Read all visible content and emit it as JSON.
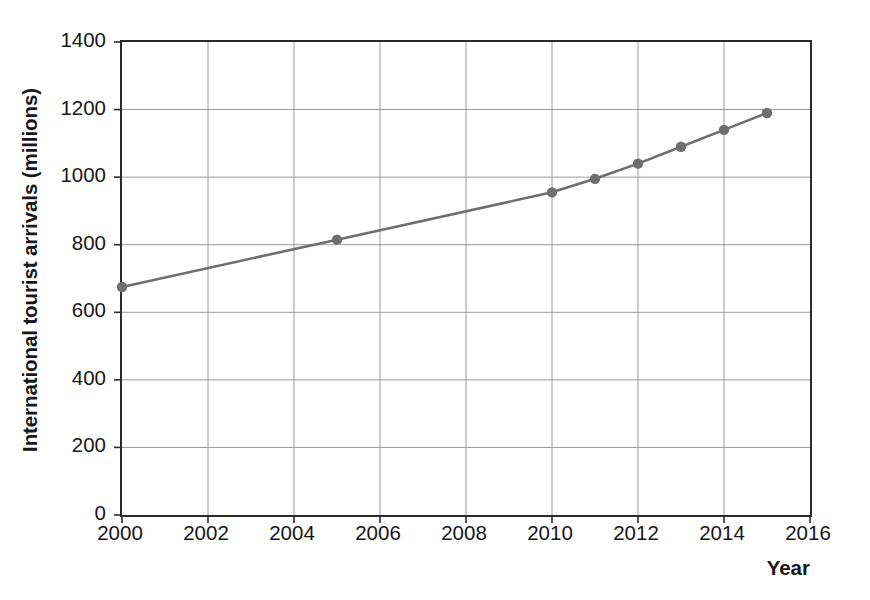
{
  "chart_data": {
    "type": "line",
    "title": "",
    "subtitle": "",
    "xlabel": "Year",
    "ylabel": "International tourist arrivals (millions)",
    "xlim": [
      2000,
      2016
    ],
    "ylim": [
      0,
      1400
    ],
    "xticks": [
      2000,
      2002,
      2004,
      2006,
      2008,
      2010,
      2012,
      2014,
      2016
    ],
    "yticks": [
      0,
      200,
      400,
      600,
      800,
      1000,
      1200,
      1400
    ],
    "xtick_labels": [
      "2000",
      "2002",
      "2004",
      "2006",
      "2008",
      "2010",
      "2012",
      "2014",
      "2016"
    ],
    "ytick_labels": [
      "0",
      "200",
      "400",
      "600",
      "800",
      "1000",
      "1200",
      "1400"
    ],
    "grid": true,
    "grid_axis": "both",
    "legend": null,
    "legend_position": "none",
    "annotations": [],
    "series": [
      {
        "name": "International tourist arrivals",
        "color": "#6e6e6e",
        "marker": "circle",
        "x": [
          2000,
          2005,
          2010,
          2011,
          2012,
          2013,
          2014,
          2015
        ],
        "values": [
          675,
          815,
          955,
          995,
          1040,
          1090,
          1140,
          1190
        ],
        "points": [
          {
            "x": 2000,
            "y": 675
          },
          {
            "x": 2005,
            "y": 815
          },
          {
            "x": 2010,
            "y": 955
          },
          {
            "x": 2011,
            "y": 995
          },
          {
            "x": 2012,
            "y": 1040
          },
          {
            "x": 2013,
            "y": 1090
          },
          {
            "x": 2014,
            "y": 1140
          },
          {
            "x": 2015,
            "y": 1190
          }
        ]
      }
    ]
  },
  "style": {
    "line_color": "#6e6e6e",
    "marker_color": "#6e6e6e",
    "grid_color": "#9a9a9a",
    "frame_color": "#2b2b2b",
    "text_color": "#17171a",
    "background": "#ffffff",
    "line_width": 2.6,
    "marker_radius": 5.2
  }
}
